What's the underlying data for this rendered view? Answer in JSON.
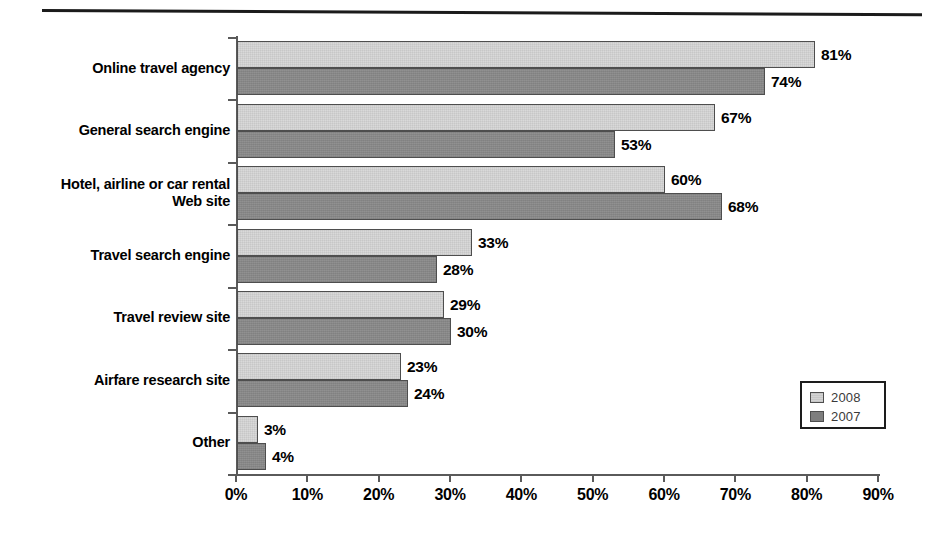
{
  "chart_data": {
    "type": "bar",
    "orientation": "horizontal",
    "title": "",
    "subtitle": "",
    "xlabel": "",
    "ylabel": "",
    "xlim": [
      0,
      90
    ],
    "xtick_labels": [
      "0%",
      "10%",
      "20%",
      "30%",
      "40%",
      "50%",
      "60%",
      "70%",
      "80%",
      "90%"
    ],
    "xtick_values": [
      0,
      10,
      20,
      30,
      40,
      50,
      60,
      70,
      80,
      90
    ],
    "grid": false,
    "value_label_suffix": "%",
    "categories": [
      "Online travel agency",
      "General search engine",
      "Hotel, airline or car rental\nWeb site",
      "Travel search engine",
      "Travel review site",
      "Airfare research site",
      "Other"
    ],
    "series": [
      {
        "name": "2008",
        "color": "#d9d9d9",
        "values": [
          81,
          67,
          60,
          33,
          29,
          23,
          3
        ],
        "value_labels": [
          "81%",
          "67%",
          "60%",
          "33%",
          "29%",
          "23%",
          "3%"
        ]
      },
      {
        "name": "2007",
        "color": "#8b8b8b",
        "values": [
          74,
          53,
          68,
          28,
          30,
          24,
          4
        ],
        "value_labels": [
          "74%",
          "53%",
          "68%",
          "28%",
          "30%",
          "24%",
          "4%"
        ]
      }
    ],
    "legend": {
      "position": "bottom-right",
      "entries": [
        {
          "label": "2008",
          "swatch": "light-gray"
        },
        {
          "label": "2007",
          "swatch": "dark-gray"
        }
      ]
    }
  },
  "category_lines": [
    [
      "Online travel agency"
    ],
    [
      "General search engine"
    ],
    [
      "Hotel, airline or car rental",
      "Web site"
    ],
    [
      "Travel search engine"
    ],
    [
      "Travel review site"
    ],
    [
      "Airfare research site"
    ],
    [
      "Other"
    ]
  ],
  "axis": {
    "ticks": [
      "0%",
      "10%",
      "20%",
      "30%",
      "40%",
      "50%",
      "60%",
      "70%",
      "80%",
      "90%"
    ]
  },
  "legend": {
    "entry_2008": "2008",
    "entry_2007": "2007"
  }
}
